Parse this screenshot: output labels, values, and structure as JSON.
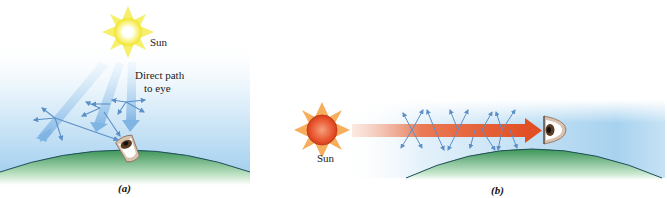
{
  "figure": {
    "panels": [
      {
        "id": "a",
        "caption": "(a)",
        "sun_label": "Sun",
        "annotation": "Direct path to eye",
        "annotation_lines": [
          "Direct path",
          "to eye"
        ],
        "sun_color": "#f2ea3a",
        "sky_color": "#a9d4f0",
        "ground_color": "#3f9a5c",
        "scatter_arrow_color": "#5b8fc9"
      },
      {
        "id": "b",
        "caption": "(b)",
        "sun_label": "Sun",
        "sun_color": "#e8532c",
        "sun_ray_color": "#f5a040",
        "beam_color": "#e5542a",
        "sky_color": "#a9d4f0",
        "ground_color": "#3f9a5c",
        "scatter_arrow_color": "#5b8fc9"
      }
    ]
  }
}
